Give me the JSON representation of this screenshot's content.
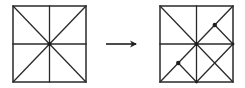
{
  "diagram": {
    "type": "geometric transformation",
    "stroke_color": "#2a2a2a",
    "dot_color": "#1e1e1e",
    "background": "#ffffff",
    "left_square": {
      "bounds": {
        "x1": 13,
        "y1": 6,
        "x2": 86,
        "y2": 82
      },
      "center": [
        49.5,
        44
      ],
      "lines": [
        {
          "name": "vertical-midline",
          "from": [
            49.5,
            6
          ],
          "to": [
            49.5,
            82
          ]
        },
        {
          "name": "horizontal-midline",
          "from": [
            13,
            44
          ],
          "to": [
            86,
            44
          ]
        },
        {
          "name": "diagonal-main",
          "from": [
            13,
            6
          ],
          "to": [
            86,
            82
          ]
        },
        {
          "name": "diagonal-anti",
          "from": [
            86,
            6
          ],
          "to": [
            13,
            82
          ]
        }
      ],
      "dots": [
        {
          "name": "center-dot",
          "at": [
            49.5,
            44
          ],
          "r": 2
        }
      ]
    },
    "arrow": {
      "from": [
        106,
        44
      ],
      "to": [
        140,
        44
      ],
      "direction": "right"
    },
    "right_square": {
      "bounds": {
        "x1": 160,
        "y1": 6,
        "x2": 233,
        "y2": 82
      },
      "center": [
        196.5,
        44
      ],
      "lines": [
        {
          "name": "vertical-midline",
          "from": [
            196.5,
            6
          ],
          "to": [
            196.5,
            82
          ]
        },
        {
          "name": "horizontal-midline",
          "from": [
            160,
            44
          ],
          "to": [
            233,
            44
          ]
        },
        {
          "name": "diagonal-main",
          "from": [
            160,
            6
          ],
          "to": [
            233,
            82
          ]
        },
        {
          "name": "diagonal-anti",
          "from": [
            233,
            6
          ],
          "to": [
            160,
            82
          ]
        },
        {
          "name": "upper-right-fold",
          "from": [
            214.75,
            25
          ],
          "to": [
            233,
            44
          ]
        },
        {
          "name": "lower-left-fold",
          "from": [
            178.25,
            63
          ],
          "to": [
            196.5,
            82
          ]
        },
        {
          "name": "lower-right-cross",
          "from": [
            233,
            44
          ],
          "to": [
            196.5,
            82
          ]
        }
      ],
      "dots": [
        {
          "name": "center-dot",
          "at": [
            196.5,
            44
          ],
          "r": 2
        },
        {
          "name": "upper-right-dot",
          "at": [
            214.75,
            25
          ],
          "r": 2.2
        },
        {
          "name": "lower-left-dot",
          "at": [
            178.25,
            63
          ],
          "r": 2.2
        },
        {
          "name": "right-mid-dot",
          "at": [
            233,
            44
          ],
          "r": 1.4
        },
        {
          "name": "bottom-mid-dot",
          "at": [
            196.5,
            82
          ],
          "r": 1.4
        }
      ]
    }
  }
}
